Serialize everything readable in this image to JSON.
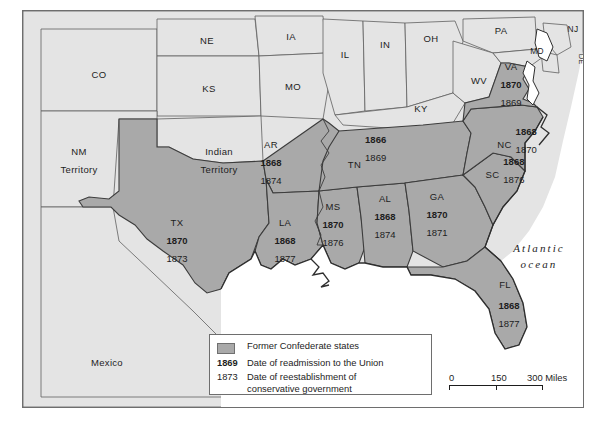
{
  "map": {
    "title": "Former Confederate states — Reconstruction readmission map",
    "ocean_label_line1": "Atlantic",
    "ocean_label_line2": "ocean",
    "colors": {
      "confederate_fill": "#a9a9a9",
      "other_fill": "#e4e4e4",
      "water_fill": "#ffffff",
      "border_stroke": "#3c3c3c",
      "frame_stroke": "#6e6e6e",
      "text": "#1d1d1d"
    },
    "confederate_states": [
      {
        "abbr": "TX",
        "readmitted": "1870",
        "conservative": "1873"
      },
      {
        "abbr": "AR",
        "readmitted": "1868",
        "conservative": "1874"
      },
      {
        "abbr": "LA",
        "readmitted": "1868",
        "conservative": "1877"
      },
      {
        "abbr": "MS",
        "readmitted": "1870",
        "conservative": "1876"
      },
      {
        "abbr": "AL",
        "readmitted": "1868",
        "conservative": "1874"
      },
      {
        "abbr": "TN",
        "readmitted": "1866",
        "conservative": "1869"
      },
      {
        "abbr": "GA",
        "readmitted": "1870",
        "conservative": "1871"
      },
      {
        "abbr": "FL",
        "readmitted": "1868",
        "conservative": "1877"
      },
      {
        "abbr": "SC",
        "readmitted": "1868",
        "conservative": "1876"
      },
      {
        "abbr": "NC",
        "readmitted": "1868",
        "conservative": "1870"
      },
      {
        "abbr": "VA",
        "readmitted": "1870",
        "conservative": "1869"
      }
    ],
    "other_labels": [
      {
        "name": "CO"
      },
      {
        "name": "NE"
      },
      {
        "name": "IA"
      },
      {
        "name": "KS"
      },
      {
        "name": "MO"
      },
      {
        "name": "IL"
      },
      {
        "name": "IN"
      },
      {
        "name": "OH"
      },
      {
        "name": "PA"
      },
      {
        "name": "MD"
      },
      {
        "name": "NJ"
      },
      {
        "name": "DE"
      },
      {
        "name": "WV"
      },
      {
        "name": "KY"
      },
      {
        "name": "NM Territory"
      },
      {
        "name": "Indian Territory"
      },
      {
        "name": "Mexico"
      }
    ],
    "nm_territory_line1": "NM",
    "nm_territory_line2": "Territory",
    "indian_territory_line1": "Indian",
    "indian_territory_line2": "Territory",
    "mexico": "Mexico"
  },
  "legend": {
    "rows": [
      {
        "key": "",
        "key_style": "swatch",
        "text": "Former Confederate states"
      },
      {
        "key": "1869",
        "key_style": "bold",
        "text": "Date of readmission to the Union"
      },
      {
        "key": "1873",
        "key_style": "normal",
        "text": "Date of reestablishment of\nconservative government"
      }
    ],
    "swatch_label": "Former Confederate states",
    "readmission_key": "1869",
    "readmission_text": "Date of readmission to the Union",
    "conservative_key": "1873",
    "conservative_text_line1": "Date of reestablishment of",
    "conservative_text_line2": "conservative government"
  },
  "scale": {
    "zero": "0",
    "mid": "150",
    "max": "300 Miles"
  },
  "caption": ""
}
